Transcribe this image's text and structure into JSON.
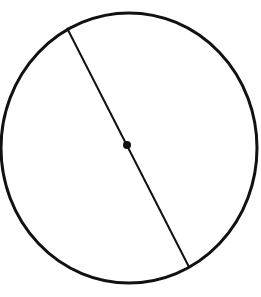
{
  "diagram": {
    "type": "circle-with-diameter",
    "colors": {
      "background": "#ffffff",
      "stroke": "#111111"
    },
    "circle": {
      "cx": 129,
      "cy": 148,
      "rx": 128,
      "ry": 135,
      "stroke_width": 3
    },
    "diameter": {
      "x1": 67,
      "y1": 28,
      "x2": 189,
      "y2": 267,
      "stroke_width": 2
    },
    "center_point": {
      "cx": 127,
      "cy": 145,
      "r": 4
    }
  }
}
